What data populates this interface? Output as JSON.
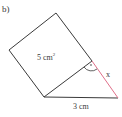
{
  "figure": {
    "part_label": "b)",
    "square_area_label": "5 cm",
    "square_area_exp": "2",
    "hypotenuse_label": "x",
    "base_label": "3 cm",
    "colors": {
      "line": "#3a3a3a",
      "highlight": "#e0708a"
    }
  }
}
